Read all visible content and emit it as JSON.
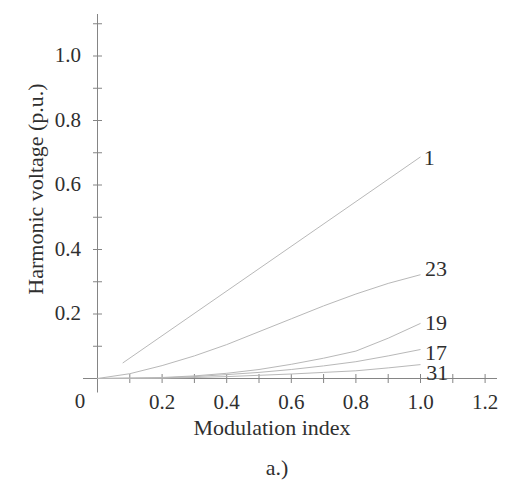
{
  "figure": {
    "caption": "a.)"
  },
  "chart_data": {
    "type": "line",
    "title": "",
    "xlabel": "Modulation index",
    "ylabel": "Harmonic voltage (p.u.)",
    "xlim": [
      0,
      1.25
    ],
    "ylim": [
      0,
      1.1
    ],
    "grid": false,
    "legend": "inline-labels-at-line-ends",
    "origin_label": "0",
    "x_tick_step_minor": 0.1,
    "y_tick_step_minor": 0.1,
    "x_ticks_all": [
      0.1,
      0.2,
      0.3,
      0.4,
      0.5,
      0.6,
      0.7,
      0.8,
      0.9,
      1.0,
      1.1,
      1.2
    ],
    "x_labeled_ticks": [
      0.2,
      0.4,
      0.6,
      0.8,
      1.0,
      1.2
    ],
    "x_tick_labels": [
      "0.2",
      "0.4",
      "0.6",
      "0.8",
      "1.0",
      "1.2"
    ],
    "y_ticks_all": [
      0.1,
      0.2,
      0.3,
      0.4,
      0.5,
      0.6,
      0.7,
      0.8,
      0.9,
      1.0,
      1.1
    ],
    "y_labeled_ticks": [
      0.2,
      0.4,
      0.6,
      0.8,
      1.0
    ],
    "y_tick_labels": [
      "0.2",
      "0.4",
      "0.6",
      "0.8",
      "1.0"
    ],
    "series": [
      {
        "name": "1",
        "x": [
          0.078,
          1.0
        ],
        "y": [
          0.048,
          0.687
        ],
        "label": "1",
        "label_at": [
          1.027,
          0.683
        ]
      },
      {
        "name": "23",
        "x": [
          0,
          0.1,
          0.2,
          0.3,
          0.4,
          0.5,
          0.6,
          0.7,
          0.8,
          0.9,
          1.0
        ],
        "y": [
          0,
          0.015,
          0.04,
          0.07,
          0.105,
          0.145,
          0.185,
          0.225,
          0.262,
          0.295,
          0.322
        ],
        "label": "23",
        "label_at": [
          1.048,
          0.338
        ]
      },
      {
        "name": "19",
        "x": [
          0,
          0.1,
          0.2,
          0.3,
          0.4,
          0.5,
          0.6,
          0.7,
          0.8,
          0.9,
          1.0
        ],
        "y": [
          0,
          0.001,
          0.003,
          0.008,
          0.016,
          0.028,
          0.044,
          0.063,
          0.085,
          0.125,
          0.171
        ],
        "label": "19",
        "label_at": [
          1.048,
          0.173
        ]
      },
      {
        "name": "17",
        "x": [
          0,
          0.1,
          0.2,
          0.3,
          0.4,
          0.5,
          0.6,
          0.7,
          0.8,
          0.9,
          1.0
        ],
        "y": [
          0,
          0.001,
          0.002,
          0.006,
          0.012,
          0.019,
          0.028,
          0.039,
          0.052,
          0.07,
          0.09
        ],
        "label": "17",
        "label_at": [
          1.048,
          0.08
        ]
      },
      {
        "name": "31",
        "x": [
          0,
          0.1,
          0.2,
          0.3,
          0.4,
          0.5,
          0.6,
          0.7,
          0.8,
          0.9,
          1.0
        ],
        "y": [
          0,
          0.0005,
          0.001,
          0.003,
          0.006,
          0.01,
          0.014,
          0.019,
          0.024,
          0.033,
          0.043
        ],
        "label": "31",
        "label_at": [
          1.052,
          0.017
        ]
      }
    ],
    "colors": {
      "background": "#ffffff",
      "line": "#b8b8b8",
      "axis": "#858585",
      "text": "#2f2f2f"
    }
  }
}
